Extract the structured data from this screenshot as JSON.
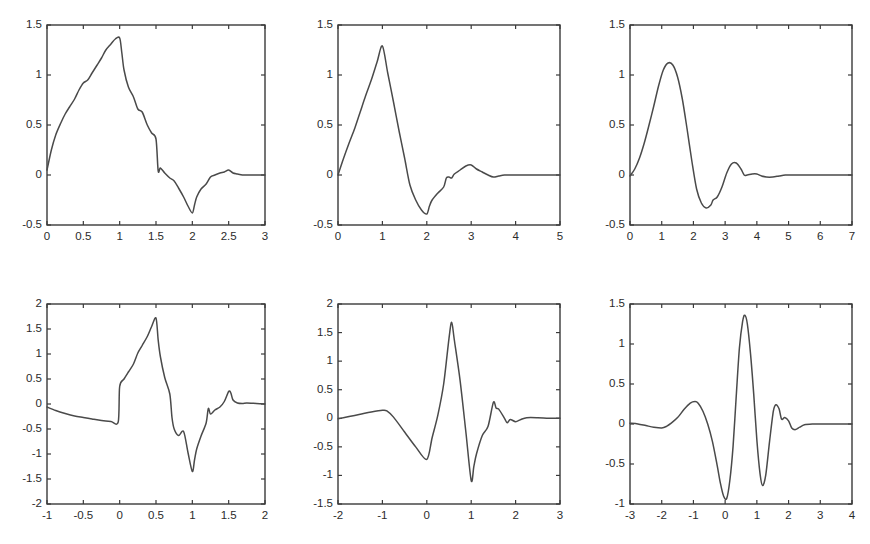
{
  "figure": {
    "background_color": "#ffffff",
    "line_color": "#4a4a4a",
    "axis_color": "#3a3a3a",
    "rows": 2,
    "cols": 3
  },
  "chart_data": [
    {
      "id": "db2-scaling-function",
      "type": "line",
      "title": "",
      "xlabel": "",
      "ylabel": "",
      "xlim": [
        0,
        3
      ],
      "ylim": [
        -0.5,
        1.5
      ],
      "xticks": [
        0,
        0.5,
        1,
        1.5,
        2,
        2.5,
        3
      ],
      "xticklabels": [
        "0",
        "0.5",
        "1",
        "1.5",
        "2",
        "2.5",
        "3"
      ],
      "yticks": [
        -0.5,
        0,
        0.5,
        1,
        1.5
      ],
      "yticklabels": [
        "-0.5",
        "0",
        "0.5",
        "1",
        "1.5"
      ],
      "grid": false,
      "legend": "none",
      "series": [
        {
          "name": "phi",
          "x": [
            0.0,
            0.06,
            0.12,
            0.19,
            0.25,
            0.31,
            0.38,
            0.44,
            0.5,
            0.56,
            0.62,
            0.69,
            0.75,
            0.81,
            0.88,
            0.94,
            1.0,
            1.03,
            1.06,
            1.12,
            1.19,
            1.25,
            1.31,
            1.38,
            1.44,
            1.5,
            1.53,
            1.56,
            1.62,
            1.69,
            1.75,
            1.81,
            1.88,
            1.94,
            2.0,
            2.03,
            2.06,
            2.12,
            2.19,
            2.25,
            2.31,
            2.38,
            2.44,
            2.5,
            2.56,
            2.62,
            2.69,
            2.75,
            2.88,
            3.0
          ],
          "y": [
            0.05,
            0.25,
            0.4,
            0.52,
            0.61,
            0.68,
            0.76,
            0.85,
            0.92,
            0.95,
            1.02,
            1.1,
            1.17,
            1.25,
            1.31,
            1.36,
            1.37,
            1.22,
            1.05,
            0.88,
            0.78,
            0.66,
            0.63,
            0.5,
            0.42,
            0.36,
            0.04,
            0.07,
            0.02,
            -0.03,
            -0.06,
            -0.13,
            -0.22,
            -0.31,
            -0.38,
            -0.3,
            -0.22,
            -0.14,
            -0.09,
            -0.02,
            0.0,
            0.02,
            0.03,
            0.05,
            0.02,
            0.01,
            0.0,
            0.0,
            0.0,
            0.0
          ]
        }
      ]
    },
    {
      "id": "db3-scaling-function",
      "type": "line",
      "title": "",
      "xlabel": "",
      "ylabel": "",
      "xlim": [
        0,
        5
      ],
      "ylim": [
        -0.5,
        1.5
      ],
      "xticks": [
        0,
        1,
        2,
        3,
        4,
        5
      ],
      "xticklabels": [
        "0",
        "1",
        "2",
        "3",
        "4",
        "5"
      ],
      "yticks": [
        -0.5,
        0,
        0.5,
        1,
        1.5
      ],
      "yticklabels": [
        "-0.5",
        "0",
        "0.5",
        "1",
        "1.5"
      ],
      "grid": false,
      "legend": "none",
      "series": [
        {
          "name": "phi",
          "x": [
            0.0,
            0.12,
            0.25,
            0.38,
            0.5,
            0.62,
            0.75,
            0.88,
            1.0,
            1.12,
            1.25,
            1.38,
            1.5,
            1.62,
            1.75,
            1.88,
            2.0,
            2.06,
            2.12,
            2.25,
            2.38,
            2.44,
            2.5,
            2.56,
            2.62,
            2.75,
            2.88,
            3.0,
            3.12,
            3.25,
            3.38,
            3.5,
            3.62,
            3.75,
            4.0,
            4.5,
            5.0
          ],
          "y": [
            0.0,
            0.16,
            0.32,
            0.47,
            0.63,
            0.79,
            0.95,
            1.13,
            1.29,
            1.02,
            0.73,
            0.43,
            0.17,
            -0.1,
            -0.25,
            -0.35,
            -0.39,
            -0.31,
            -0.25,
            -0.18,
            -0.12,
            -0.03,
            -0.02,
            -0.03,
            0.01,
            0.05,
            0.09,
            0.1,
            0.06,
            0.03,
            0.0,
            -0.02,
            -0.01,
            0.0,
            0.0,
            0.0,
            0.0
          ]
        }
      ]
    },
    {
      "id": "db4-scaling-function",
      "type": "line",
      "title": "",
      "xlabel": "",
      "ylabel": "",
      "xlim": [
        0,
        7
      ],
      "ylim": [
        -0.5,
        1.5
      ],
      "xticks": [
        0,
        1,
        2,
        3,
        4,
        5,
        6,
        7
      ],
      "xticklabels": [
        "0",
        "1",
        "2",
        "3",
        "4",
        "5",
        "6",
        "7"
      ],
      "yticks": [
        -0.5,
        0,
        0.5,
        1,
        1.5
      ],
      "yticklabels": [
        "-0.5",
        "0",
        "0.5",
        "1",
        "1.5"
      ],
      "grid": false,
      "legend": "none",
      "series": [
        {
          "name": "phi",
          "x": [
            0.0,
            0.15,
            0.3,
            0.45,
            0.6,
            0.75,
            0.9,
            1.05,
            1.2,
            1.35,
            1.5,
            1.65,
            1.8,
            1.95,
            2.1,
            2.25,
            2.4,
            2.55,
            2.62,
            2.75,
            2.9,
            3.05,
            3.2,
            3.35,
            3.5,
            3.6,
            3.7,
            3.85,
            4.0,
            4.15,
            4.3,
            4.5,
            4.7,
            4.9,
            5.2,
            5.6,
            6.0,
            6.5,
            7.0
          ],
          "y": [
            -0.01,
            0.06,
            0.17,
            0.32,
            0.5,
            0.69,
            0.89,
            1.05,
            1.12,
            1.1,
            0.98,
            0.76,
            0.46,
            0.14,
            -0.14,
            -0.28,
            -0.33,
            -0.3,
            -0.25,
            -0.22,
            -0.12,
            0.02,
            0.11,
            0.12,
            0.06,
            0.0,
            0.0,
            0.01,
            0.01,
            -0.01,
            -0.02,
            -0.02,
            -0.01,
            0.0,
            0.0,
            0.0,
            0.0,
            0.0,
            0.0
          ]
        }
      ]
    },
    {
      "id": "db2-wavelet-function",
      "type": "line",
      "title": "",
      "xlabel": "",
      "ylabel": "",
      "xlim": [
        -1,
        2
      ],
      "ylim": [
        -2,
        2
      ],
      "xticks": [
        -1,
        -0.5,
        0,
        0.5,
        1,
        1.5,
        2
      ],
      "xticklabels": [
        "-1",
        "-0.5",
        "0",
        "0.5",
        "1",
        "1.5",
        "2"
      ],
      "yticks": [
        -2,
        -1.5,
        -1,
        -0.5,
        0,
        0.5,
        1,
        1.5,
        2
      ],
      "yticklabels": [
        "-2",
        "-1.5",
        "-1",
        "-0.5",
        "0",
        "0.5",
        "1",
        "1.5",
        "2"
      ],
      "grid": false,
      "legend": "none",
      "series": [
        {
          "name": "psi",
          "x": [
            -1.0,
            -0.88,
            -0.75,
            -0.62,
            -0.5,
            -0.38,
            -0.25,
            -0.12,
            -0.02,
            0.0,
            0.06,
            0.12,
            0.19,
            0.25,
            0.31,
            0.38,
            0.44,
            0.5,
            0.53,
            0.56,
            0.62,
            0.69,
            0.72,
            0.75,
            0.81,
            0.88,
            0.94,
            1.0,
            1.03,
            1.06,
            1.12,
            1.19,
            1.22,
            1.25,
            1.31,
            1.38,
            1.44,
            1.5,
            1.53,
            1.56,
            1.62,
            1.69,
            1.75,
            1.88,
            2.0
          ],
          "y": [
            -0.06,
            -0.13,
            -0.19,
            -0.24,
            -0.27,
            -0.3,
            -0.33,
            -0.35,
            -0.36,
            0.35,
            0.5,
            0.64,
            0.8,
            1.02,
            1.17,
            1.35,
            1.55,
            1.72,
            1.28,
            0.95,
            0.53,
            0.2,
            -0.27,
            -0.5,
            -0.63,
            -0.55,
            -0.97,
            -1.35,
            -1.12,
            -0.9,
            -0.64,
            -0.38,
            -0.09,
            -0.2,
            -0.12,
            -0.06,
            0.05,
            0.25,
            0.22,
            0.08,
            0.02,
            0.01,
            0.02,
            0.01,
            0.0
          ]
        }
      ]
    },
    {
      "id": "db3-wavelet-function",
      "type": "line",
      "title": "",
      "xlabel": "",
      "ylabel": "",
      "xlim": [
        -2,
        3
      ],
      "ylim": [
        -1.5,
        2
      ],
      "xticks": [
        -2,
        -1,
        0,
        1,
        2,
        3
      ],
      "xticklabels": [
        "-2",
        "-1",
        "0",
        "1",
        "2",
        "3"
      ],
      "yticks": [
        -1.5,
        -1,
        -0.5,
        0,
        0.5,
        1,
        1.5,
        2
      ],
      "yticklabels": [
        "-1.5",
        "-1",
        "-0.5",
        "0",
        "0.5",
        "1",
        "1.5",
        "2"
      ],
      "grid": false,
      "legend": "none",
      "series": [
        {
          "name": "psi",
          "x": [
            -2.0,
            -1.75,
            -1.5,
            -1.25,
            -1.0,
            -0.9,
            -0.75,
            -0.5,
            -0.25,
            0.0,
            0.12,
            0.25,
            0.38,
            0.5,
            0.56,
            0.62,
            0.75,
            0.88,
            1.0,
            1.06,
            1.12,
            1.25,
            1.38,
            1.5,
            1.56,
            1.62,
            1.75,
            1.81,
            1.88,
            2.0,
            2.12,
            2.25,
            2.5,
            2.75,
            3.0
          ],
          "y": [
            -0.01,
            0.03,
            0.07,
            0.11,
            0.14,
            0.13,
            0.02,
            -0.24,
            -0.5,
            -0.72,
            -0.34,
            0.06,
            0.6,
            1.4,
            1.68,
            1.37,
            0.66,
            -0.24,
            -1.09,
            -0.84,
            -0.62,
            -0.3,
            -0.14,
            0.28,
            0.18,
            0.16,
            0.0,
            -0.08,
            -0.02,
            -0.06,
            -0.02,
            0.01,
            0.01,
            0.0,
            0.0
          ]
        }
      ]
    },
    {
      "id": "db4-wavelet-function",
      "type": "line",
      "title": "",
      "xlabel": "",
      "ylabel": "",
      "xlim": [
        -3,
        4
      ],
      "ylim": [
        -1,
        1.5
      ],
      "xticks": [
        -3,
        -2,
        -1,
        0,
        1,
        2,
        3,
        4
      ],
      "xticklabels": [
        "-3",
        "-2",
        "-1",
        "0",
        "1",
        "2",
        "3",
        "4"
      ],
      "yticks": [
        -1,
        -0.5,
        0,
        0.5,
        1,
        1.5
      ],
      "yticklabels": [
        "-1",
        "-0.5",
        "0",
        "0.5",
        "1",
        "1.5"
      ],
      "grid": false,
      "legend": "none",
      "series": [
        {
          "name": "psi",
          "x": [
            -3.0,
            -2.75,
            -2.5,
            -2.25,
            -2.0,
            -1.85,
            -1.7,
            -1.5,
            -1.3,
            -1.1,
            -0.95,
            -0.85,
            -0.7,
            -0.55,
            -0.4,
            -0.25,
            -0.15,
            -0.05,
            0.05,
            0.15,
            0.25,
            0.35,
            0.45,
            0.55,
            0.62,
            0.7,
            0.8,
            0.9,
            1.0,
            1.1,
            1.18,
            1.28,
            1.4,
            1.52,
            1.6,
            1.7,
            1.78,
            1.88,
            2.0,
            2.1,
            2.22,
            2.35,
            2.5,
            2.75,
            3.0,
            3.4,
            3.7,
            4.0
          ],
          "y": [
            0.01,
            0.0,
            -0.02,
            -0.04,
            -0.05,
            -0.03,
            0.01,
            0.08,
            0.18,
            0.26,
            0.28,
            0.26,
            0.16,
            0.0,
            -0.22,
            -0.52,
            -0.74,
            -0.9,
            -0.93,
            -0.7,
            -0.28,
            0.35,
            0.95,
            1.28,
            1.36,
            1.25,
            0.88,
            0.38,
            -0.2,
            -0.62,
            -0.77,
            -0.64,
            -0.22,
            0.16,
            0.24,
            0.19,
            0.06,
            0.08,
            0.04,
            -0.05,
            -0.07,
            -0.04,
            -0.01,
            0.0,
            0.0,
            0.0,
            0.0,
            0.0
          ]
        }
      ]
    }
  ],
  "subplot_layout": [
    {
      "chart_index": 0,
      "left": 47,
      "top": 25,
      "width": 218,
      "height": 200
    },
    {
      "chart_index": 1,
      "left": 338,
      "top": 25,
      "width": 222,
      "height": 200
    },
    {
      "chart_index": 2,
      "left": 630,
      "top": 25,
      "width": 222,
      "height": 200
    },
    {
      "chart_index": 3,
      "left": 47,
      "top": 304,
      "width": 218,
      "height": 200
    },
    {
      "chart_index": 4,
      "left": 338,
      "top": 304,
      "width": 222,
      "height": 200
    },
    {
      "chart_index": 5,
      "left": 630,
      "top": 304,
      "width": 222,
      "height": 200
    }
  ]
}
